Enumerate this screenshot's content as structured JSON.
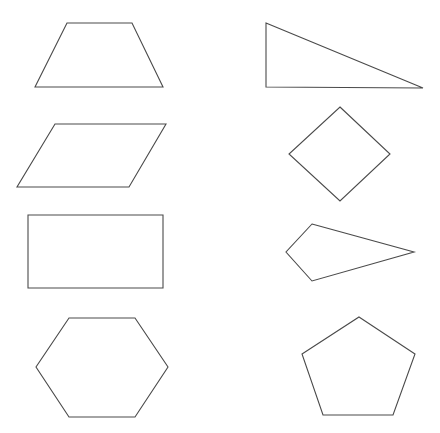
{
  "diagram": {
    "background": "#ffffff",
    "stroke_color": "#4a4a4a",
    "layout": "two-column grid of 8 outlined geometric shapes",
    "shapes": [
      {
        "id": "trapezoid",
        "name": "Trapezoid",
        "column": "left",
        "row": 1,
        "points": "67,23 132,23 163,87 35,87"
      },
      {
        "id": "right-triangle",
        "name": "Right Triangle",
        "column": "right",
        "row": 1,
        "points": "266,23 423,88 266,87"
      },
      {
        "id": "parallelogram",
        "name": "Parallelogram",
        "column": "left",
        "row": 2,
        "points": "55,124 166,124 129,187 17,187"
      },
      {
        "id": "rhombus",
        "name": "Rhombus (Square rotated)",
        "column": "right",
        "row": 2,
        "points": "340,107 390,154 340,201 289,154"
      },
      {
        "id": "rectangle",
        "name": "Rectangle",
        "column": "left",
        "row": 3,
        "points": "28,215 163,215 163,288 28,288"
      },
      {
        "id": "kite",
        "name": "Kite",
        "column": "right",
        "row": 3,
        "points": "312,224 414,252 312,281 286,252"
      },
      {
        "id": "hexagon",
        "name": "Hexagon",
        "column": "left",
        "row": 4,
        "points": "69,318 135,318 168,367 135,417 69,417 36,367"
      },
      {
        "id": "pentagon",
        "name": "Pentagon",
        "column": "right",
        "row": 4,
        "points": "359,317 415,354 393,415 323,415 302,354"
      }
    ]
  }
}
